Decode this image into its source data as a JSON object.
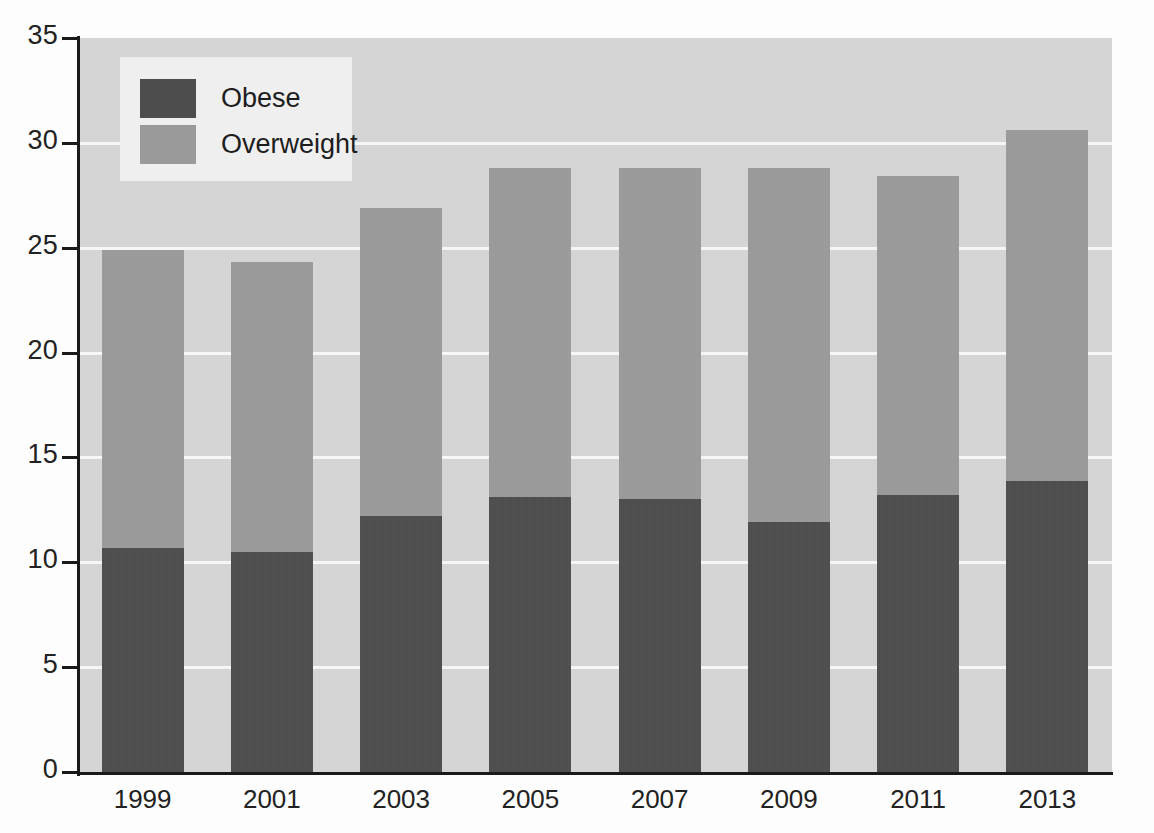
{
  "chart_data": {
    "type": "bar",
    "subtype": "stacked",
    "title": "",
    "subtitle": "",
    "xlabel": "",
    "ylabel": "",
    "categories": [
      "1999",
      "2001",
      "2003",
      "2005",
      "2007",
      "2009",
      "2011",
      "2013"
    ],
    "series": [
      {
        "name": "Obese",
        "color": "#4d4d4d",
        "values": [
          10.7,
          10.5,
          12.2,
          13.1,
          13.0,
          11.9,
          13.2,
          13.9
        ]
      },
      {
        "name": "Overweight",
        "color": "#9a9a9a",
        "values": [
          14.2,
          13.8,
          14.7,
          15.7,
          15.8,
          16.9,
          15.2,
          16.7
        ]
      }
    ],
    "totals": [
      24.9,
      24.3,
      26.9,
      28.8,
      28.8,
      28.8,
      28.4,
      30.6
    ],
    "ylim": [
      0,
      35
    ],
    "ytick_labels": [
      "0",
      "5",
      "10",
      "15",
      "20",
      "25",
      "30",
      "35"
    ],
    "ytick_values": [
      0,
      5,
      10,
      15,
      20,
      25,
      30,
      35
    ],
    "xtick_labels": [
      "1999",
      "2001",
      "2003",
      "2005",
      "2007",
      "2009",
      "2011",
      "2013"
    ],
    "grid": true,
    "gridline_color": "#f7f7f7",
    "plot_background": "#d5d5d5",
    "legend": {
      "position": "top-left",
      "background": "#efefef",
      "entries": [
        {
          "label": "Obese",
          "color": "#4d4d4d"
        },
        {
          "label": "Overweight",
          "color": "#9a9a9a"
        }
      ]
    }
  },
  "axis": {
    "y_ticks": [
      {
        "label": "35",
        "value": 35
      },
      {
        "label": "30",
        "value": 30
      },
      {
        "label": "25",
        "value": 25
      },
      {
        "label": "20",
        "value": 20
      },
      {
        "label": "15",
        "value": 15
      },
      {
        "label": "10",
        "value": 10
      },
      {
        "label": "5",
        "value": 5
      },
      {
        "label": "0",
        "value": 0
      }
    ],
    "x_ticks": [
      {
        "label": "1999"
      },
      {
        "label": "2001"
      },
      {
        "label": "2003"
      },
      {
        "label": "2005"
      },
      {
        "label": "2007"
      },
      {
        "label": "2009"
      },
      {
        "label": "2011"
      },
      {
        "label": "2013"
      }
    ]
  },
  "legend": {
    "entries": [
      {
        "label": "Obese"
      },
      {
        "label": "Overweight"
      }
    ]
  }
}
